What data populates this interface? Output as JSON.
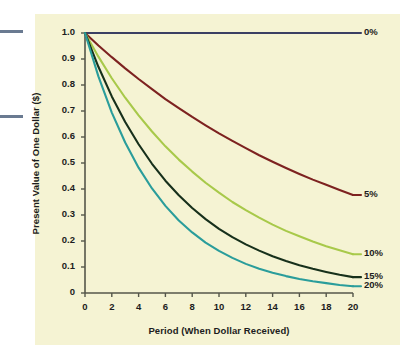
{
  "figure": {
    "background_color": "#ffffff",
    "panel_color": "#f5f3d3",
    "axis_color": "#55564a",
    "text_color": "#1c1c20",
    "margin_rule_color": "#6a7a91"
  },
  "chart_data": {
    "type": "line",
    "title": "",
    "xlabel": "Period (When Dollar Received)",
    "ylabel": "Present Value of One Dollar ($)",
    "xlim": [
      0,
      20
    ],
    "ylim": [
      0,
      1.0
    ],
    "grid": false,
    "legend_position": "right-of-line-ends",
    "xticks": [
      0,
      2,
      4,
      6,
      8,
      10,
      12,
      14,
      16,
      18,
      20
    ],
    "xticklabels": [
      "0",
      "2",
      "4",
      "6",
      "8",
      "10",
      "12",
      "14",
      "16",
      "18",
      "20"
    ],
    "yticks": [
      0,
      0.1,
      0.2,
      0.3,
      0.4,
      0.5,
      0.6,
      0.7,
      0.8,
      0.9,
      1.0
    ],
    "yticklabels": [
      "0",
      "0.1",
      "0.2",
      "0.3",
      "0.4",
      "0.5",
      "0.6",
      "0.7",
      "0.8",
      "0.9",
      "1.0"
    ],
    "x": [
      0,
      1,
      2,
      3,
      4,
      5,
      6,
      7,
      8,
      9,
      10,
      11,
      12,
      13,
      14,
      15,
      16,
      17,
      18,
      19,
      20
    ],
    "series": [
      {
        "name": "0%",
        "label": "0%",
        "rate": 0.0,
        "color": "#3b3f63",
        "values": [
          1.0,
          1.0,
          1.0,
          1.0,
          1.0,
          1.0,
          1.0,
          1.0,
          1.0,
          1.0,
          1.0,
          1.0,
          1.0,
          1.0,
          1.0,
          1.0,
          1.0,
          1.0,
          1.0,
          1.0,
          1.0
        ]
      },
      {
        "name": "5%",
        "label": "5%",
        "rate": 0.05,
        "color": "#7d2220",
        "values": [
          1.0,
          0.952,
          0.907,
          0.864,
          0.823,
          0.784,
          0.746,
          0.711,
          0.677,
          0.645,
          0.614,
          0.585,
          0.557,
          0.53,
          0.505,
          0.481,
          0.458,
          0.436,
          0.416,
          0.396,
          0.377
        ]
      },
      {
        "name": "10%",
        "label": "10%",
        "rate": 0.1,
        "color": "#a8c94a",
        "values": [
          1.0,
          0.909,
          0.826,
          0.751,
          0.683,
          0.621,
          0.564,
          0.513,
          0.467,
          0.424,
          0.386,
          0.35,
          0.319,
          0.29,
          0.263,
          0.239,
          0.218,
          0.198,
          0.18,
          0.164,
          0.149
        ]
      },
      {
        "name": "15%",
        "label": "15%",
        "rate": 0.15,
        "color": "#17301b",
        "values": [
          1.0,
          0.87,
          0.756,
          0.658,
          0.572,
          0.497,
          0.432,
          0.376,
          0.327,
          0.284,
          0.247,
          0.215,
          0.187,
          0.163,
          0.141,
          0.123,
          0.107,
          0.093,
          0.081,
          0.07,
          0.061
        ]
      },
      {
        "name": "20%",
        "label": "20%",
        "rate": 0.2,
        "color": "#2a9d9b",
        "values": [
          1.0,
          0.833,
          0.694,
          0.579,
          0.482,
          0.402,
          0.335,
          0.279,
          0.233,
          0.194,
          0.162,
          0.135,
          0.112,
          0.093,
          0.078,
          0.065,
          0.054,
          0.045,
          0.038,
          0.031,
          0.026
        ]
      }
    ]
  }
}
